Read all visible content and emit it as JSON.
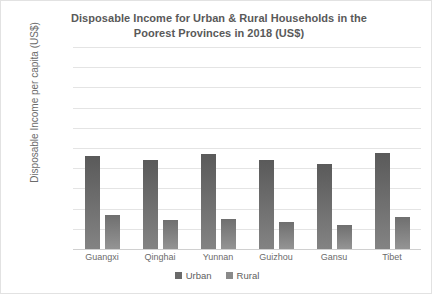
{
  "chart_data": {
    "type": "bar",
    "title": "Disposable Income for Urban & Rural Households in the Poorest Provinces in 2018 (US$)",
    "title_line1": "Disposable Income for Urban & Rural Households in the",
    "title_line2": "Poorest Provinces in 2018 (US$)",
    "xlabel": "",
    "ylabel": "Disposable Income per capita (US$)",
    "ylim": [
      0,
      10000
    ],
    "ytick_step": 1000,
    "grid": true,
    "legend_position": "bottom",
    "categories": [
      "Guangxi",
      "Qinghai",
      "Yunnan",
      "Guizhou",
      "Gansu",
      "Tibet"
    ],
    "ytick_labels": [
      "10,000",
      "9,000",
      "8,000",
      "7,000",
      "6,000",
      "5,000",
      "4,000",
      "3,000",
      "2,000",
      "1,000",
      "0"
    ],
    "series": [
      {
        "name": "Urban",
        "color": "#6a6a6a",
        "values": [
          4600,
          4400,
          4700,
          4400,
          4200,
          4750
        ]
      },
      {
        "name": "Rural",
        "color": "#8a8a8a",
        "values": [
          1700,
          1450,
          1500,
          1350,
          1200,
          1600
        ]
      }
    ]
  }
}
